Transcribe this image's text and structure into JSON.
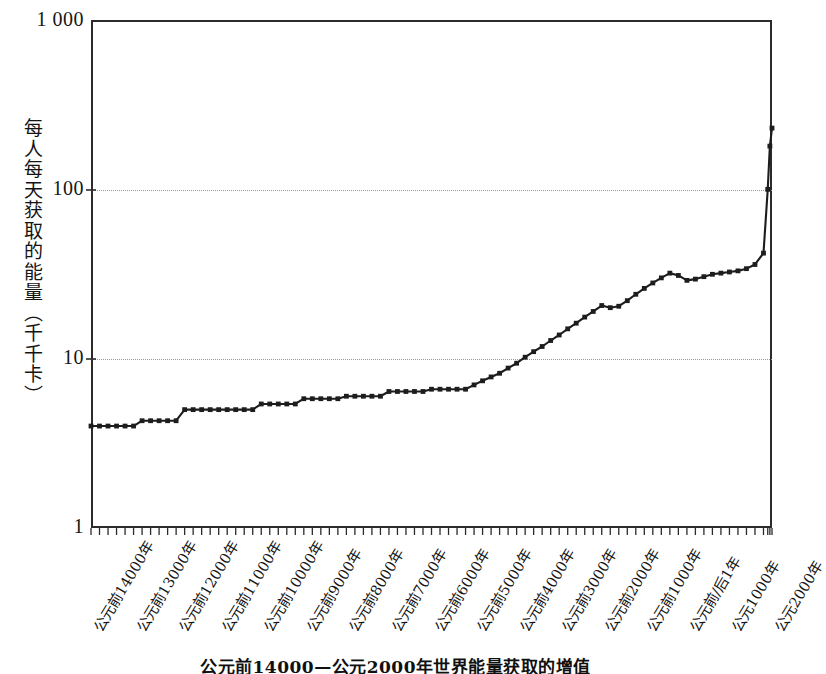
{
  "figure": {
    "caption": "公元前14000—公元2000年世界能量获取的增值",
    "y_axis_title": "每人每天获取的能量（千千卡）"
  },
  "chart_data": {
    "type": "line",
    "title": "公元前14000—公元2000年世界能量获取的增值",
    "xlabel": "",
    "ylabel": "每人每天获取的能量（千千卡）",
    "yscale": "log",
    "ylim": [
      1,
      1000
    ],
    "ytick_labels": [
      "1 000",
      "100",
      "10",
      "1"
    ],
    "ytick_values": [
      1000,
      100,
      10,
      1
    ],
    "gridlines": [
      100,
      10
    ],
    "grid": "horizontal-dotted",
    "legend": "none",
    "marker": "small-square",
    "line_color": "#1d1d1d",
    "xtick_labels": [
      "公元前14000年",
      "公元前13000年",
      "公元前12000年",
      "公元前11000年",
      "公元前10000年",
      "公元前9000年",
      "公元前8000年",
      "公元前7000年",
      "公元前6000年",
      "公元前5000年",
      "公元前4000年",
      "公元前3000年",
      "公元前2000年",
      "公元前1000年",
      "公元前/后1年",
      "公元1000年",
      "公元2000年"
    ],
    "xtick_values": [
      -14000,
      -13000,
      -12000,
      -11000,
      -10000,
      -9000,
      -8000,
      -7000,
      -6000,
      -5000,
      -4000,
      -3000,
      -2000,
      -1000,
      1,
      1000,
      2000
    ],
    "x": [
      -14000,
      -13800,
      -13600,
      -13400,
      -13200,
      -13000,
      -12800,
      -12600,
      -12400,
      -12200,
      -12000,
      -11800,
      -11600,
      -11400,
      -11200,
      -11000,
      -10800,
      -10600,
      -10400,
      -10200,
      -10000,
      -9800,
      -9600,
      -9400,
      -9200,
      -9000,
      -8800,
      -8600,
      -8400,
      -8200,
      -8000,
      -7800,
      -7600,
      -7400,
      -7200,
      -7000,
      -6800,
      -6600,
      -6400,
      -6200,
      -6000,
      -5800,
      -5600,
      -5400,
      -5200,
      -5000,
      -4800,
      -4600,
      -4400,
      -4200,
      -4000,
      -3800,
      -3600,
      -3400,
      -3200,
      -3000,
      -2800,
      -2600,
      -2400,
      -2200,
      -2000,
      -1800,
      -1600,
      -1400,
      -1200,
      -1000,
      -800,
      -600,
      -400,
      -200,
      1,
      200,
      400,
      600,
      800,
      1000,
      1200,
      1400,
      1600,
      1800,
      1900,
      1950,
      2000
    ],
    "values": [
      4.0,
      4.0,
      4.0,
      4.0,
      4.0,
      4.0,
      4.3,
      4.3,
      4.3,
      4.3,
      4.3,
      5.0,
      5.0,
      5.0,
      5.0,
      5.0,
      5.0,
      5.0,
      5.0,
      5.0,
      5.4,
      5.4,
      5.4,
      5.4,
      5.4,
      5.8,
      5.8,
      5.8,
      5.8,
      5.8,
      6.0,
      6.0,
      6.0,
      6.0,
      6.0,
      6.4,
      6.4,
      6.4,
      6.4,
      6.4,
      6.6,
      6.6,
      6.6,
      6.6,
      6.6,
      7.0,
      7.4,
      7.8,
      8.2,
      8.8,
      9.4,
      10.2,
      11.0,
      11.8,
      12.8,
      13.8,
      15.0,
      16.2,
      17.6,
      19.0,
      20.6,
      20.0,
      20.4,
      22.0,
      24.0,
      26.0,
      28.0,
      30.0,
      32.0,
      31.0,
      29.0,
      29.5,
      30.5,
      31.5,
      32.0,
      32.5,
      33.0,
      34.0,
      36.0,
      42.0,
      100.0,
      180.0,
      230.0
    ],
    "series_note": "stepped plateaus before ~5000 BCE, steady rise after, sharp exponential rise after 1800 CE",
    "annotations": []
  }
}
